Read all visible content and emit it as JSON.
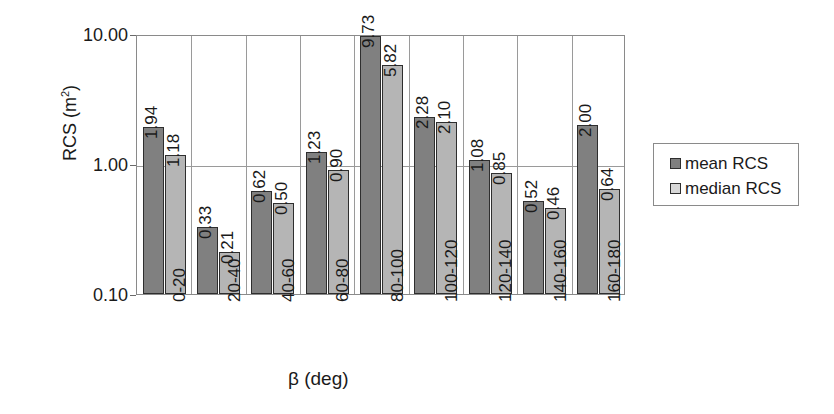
{
  "chart_data": {
    "type": "bar",
    "title": "",
    "xlabel": "β (deg)",
    "ylabel": "RCS (m²)",
    "yscale": "log",
    "ylim": [
      0.1,
      10.0
    ],
    "ytick_labels": [
      "10.00",
      "1.00",
      "0.10"
    ],
    "ytick_values": [
      10.0,
      1.0,
      0.1
    ],
    "grid": "horizontal-and-category-separators",
    "legend_position": "right",
    "categories": [
      "0-20",
      "20-40",
      "40-60",
      "60-80",
      "80-100",
      "100-120",
      "120-140",
      "140-160",
      "160-180"
    ],
    "series": [
      {
        "name": "mean RCS",
        "color": "#808080",
        "values": [
          1.94,
          0.33,
          0.62,
          1.23,
          9.73,
          2.28,
          1.08,
          0.52,
          2.0
        ],
        "labels": [
          "1.94",
          "0.33",
          "0.62",
          "1.23",
          "9.73",
          "2.28",
          "1.08",
          "0.52",
          "2.00"
        ]
      },
      {
        "name": "median RCS",
        "color": "#b5b5b5",
        "values": [
          1.18,
          0.21,
          0.5,
          0.9,
          5.82,
          2.1,
          0.85,
          0.46,
          0.64
        ],
        "labels": [
          "1.18",
          "0.21",
          "0.50",
          "0.90",
          "5.82",
          "2.10",
          "0.85",
          "0.46",
          "0.64"
        ]
      }
    ]
  },
  "axes": {
    "y_title": "RCS (m",
    "y_title_sup": "2",
    "y_title_tail": ")",
    "x_title": "β (deg)"
  },
  "legend": {
    "items": [
      {
        "label": "mean RCS"
      },
      {
        "label": "median RCS"
      }
    ]
  }
}
